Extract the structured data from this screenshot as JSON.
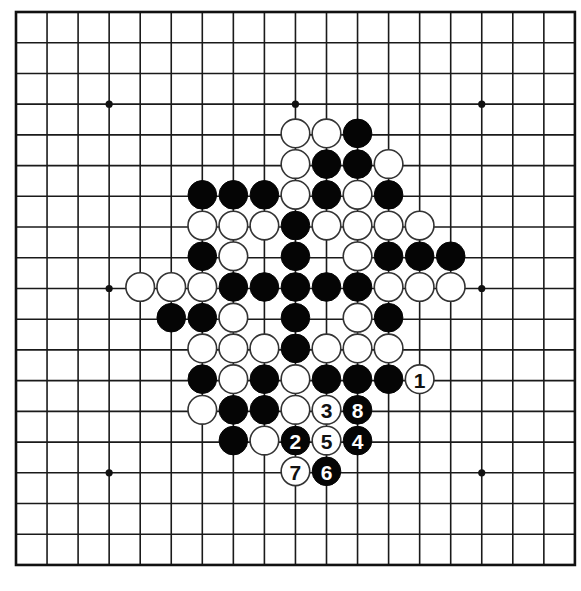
{
  "board": {
    "size": 19,
    "origin_x": 16,
    "origin_y": 12,
    "spacing_x": 31.05,
    "spacing_y": 30.72,
    "stone_radius": 14.3,
    "colors": {
      "background": "#ffffff",
      "line": "#1a1a1a",
      "black_stone": "#050505",
      "white_stone": "#ffffff",
      "white_outline": "#333333"
    },
    "star_points": [
      [
        3,
        3
      ],
      [
        3,
        9
      ],
      [
        3,
        15
      ],
      [
        9,
        3
      ],
      [
        9,
        9
      ],
      [
        9,
        15
      ],
      [
        15,
        3
      ],
      [
        15,
        9
      ],
      [
        15,
        15
      ]
    ]
  },
  "stones": [
    {
      "row": 4,
      "col": 9,
      "color": "white"
    },
    {
      "row": 4,
      "col": 10,
      "color": "white"
    },
    {
      "row": 4,
      "col": 11,
      "color": "black"
    },
    {
      "row": 5,
      "col": 9,
      "color": "white"
    },
    {
      "row": 5,
      "col": 10,
      "color": "black"
    },
    {
      "row": 5,
      "col": 11,
      "color": "black"
    },
    {
      "row": 5,
      "col": 12,
      "color": "white"
    },
    {
      "row": 6,
      "col": 6,
      "color": "black"
    },
    {
      "row": 6,
      "col": 7,
      "color": "black"
    },
    {
      "row": 6,
      "col": 8,
      "color": "black"
    },
    {
      "row": 6,
      "col": 9,
      "color": "white"
    },
    {
      "row": 6,
      "col": 10,
      "color": "black"
    },
    {
      "row": 6,
      "col": 11,
      "color": "white"
    },
    {
      "row": 6,
      "col": 12,
      "color": "black"
    },
    {
      "row": 7,
      "col": 6,
      "color": "white"
    },
    {
      "row": 7,
      "col": 7,
      "color": "white"
    },
    {
      "row": 7,
      "col": 8,
      "color": "white"
    },
    {
      "row": 7,
      "col": 9,
      "color": "black"
    },
    {
      "row": 7,
      "col": 10,
      "color": "white"
    },
    {
      "row": 7,
      "col": 11,
      "color": "white"
    },
    {
      "row": 7,
      "col": 12,
      "color": "white"
    },
    {
      "row": 7,
      "col": 13,
      "color": "white"
    },
    {
      "row": 8,
      "col": 6,
      "color": "black"
    },
    {
      "row": 8,
      "col": 7,
      "color": "white"
    },
    {
      "row": 8,
      "col": 9,
      "color": "black"
    },
    {
      "row": 8,
      "col": 11,
      "color": "white"
    },
    {
      "row": 8,
      "col": 12,
      "color": "black"
    },
    {
      "row": 8,
      "col": 13,
      "color": "black"
    },
    {
      "row": 8,
      "col": 14,
      "color": "black"
    },
    {
      "row": 9,
      "col": 4,
      "color": "white"
    },
    {
      "row": 9,
      "col": 5,
      "color": "white"
    },
    {
      "row": 9,
      "col": 6,
      "color": "white"
    },
    {
      "row": 9,
      "col": 7,
      "color": "black"
    },
    {
      "row": 9,
      "col": 8,
      "color": "black"
    },
    {
      "row": 9,
      "col": 9,
      "color": "black"
    },
    {
      "row": 9,
      "col": 10,
      "color": "black"
    },
    {
      "row": 9,
      "col": 11,
      "color": "black"
    },
    {
      "row": 9,
      "col": 12,
      "color": "white"
    },
    {
      "row": 9,
      "col": 13,
      "color": "white"
    },
    {
      "row": 9,
      "col": 14,
      "color": "white"
    },
    {
      "row": 10,
      "col": 5,
      "color": "black"
    },
    {
      "row": 10,
      "col": 6,
      "color": "black"
    },
    {
      "row": 10,
      "col": 7,
      "color": "white"
    },
    {
      "row": 10,
      "col": 9,
      "color": "black"
    },
    {
      "row": 10,
      "col": 11,
      "color": "white"
    },
    {
      "row": 10,
      "col": 12,
      "color": "black"
    },
    {
      "row": 11,
      "col": 6,
      "color": "white"
    },
    {
      "row": 11,
      "col": 7,
      "color": "white"
    },
    {
      "row": 11,
      "col": 8,
      "color": "white"
    },
    {
      "row": 11,
      "col": 9,
      "color": "black"
    },
    {
      "row": 11,
      "col": 10,
      "color": "white"
    },
    {
      "row": 11,
      "col": 11,
      "color": "white"
    },
    {
      "row": 11,
      "col": 12,
      "color": "white"
    },
    {
      "row": 12,
      "col": 6,
      "color": "black"
    },
    {
      "row": 12,
      "col": 7,
      "color": "white"
    },
    {
      "row": 12,
      "col": 8,
      "color": "black"
    },
    {
      "row": 12,
      "col": 9,
      "color": "white"
    },
    {
      "row": 12,
      "col": 10,
      "color": "black"
    },
    {
      "row": 12,
      "col": 11,
      "color": "black"
    },
    {
      "row": 12,
      "col": 12,
      "color": "black"
    },
    {
      "row": 12,
      "col": 13,
      "color": "white",
      "label": "1"
    },
    {
      "row": 13,
      "col": 6,
      "color": "white"
    },
    {
      "row": 13,
      "col": 7,
      "color": "black"
    },
    {
      "row": 13,
      "col": 8,
      "color": "black"
    },
    {
      "row": 13,
      "col": 9,
      "color": "white"
    },
    {
      "row": 13,
      "col": 10,
      "color": "white",
      "label": "3"
    },
    {
      "row": 13,
      "col": 11,
      "color": "black",
      "label": "8"
    },
    {
      "row": 14,
      "col": 7,
      "color": "black"
    },
    {
      "row": 14,
      "col": 8,
      "color": "white"
    },
    {
      "row": 14,
      "col": 9,
      "color": "black",
      "label": "2"
    },
    {
      "row": 14,
      "col": 10,
      "color": "white",
      "label": "5"
    },
    {
      "row": 14,
      "col": 11,
      "color": "black",
      "label": "4"
    },
    {
      "row": 15,
      "col": 9,
      "color": "white",
      "label": "7"
    },
    {
      "row": 15,
      "col": 10,
      "color": "black",
      "label": "6"
    }
  ],
  "move_sequence": [
    {
      "move": 1,
      "color": "white",
      "row": 12,
      "col": 13
    },
    {
      "move": 2,
      "color": "black",
      "row": 14,
      "col": 9
    },
    {
      "move": 3,
      "color": "white",
      "row": 13,
      "col": 10
    },
    {
      "move": 4,
      "color": "black",
      "row": 14,
      "col": 11
    },
    {
      "move": 5,
      "color": "white",
      "row": 14,
      "col": 10
    },
    {
      "move": 6,
      "color": "black",
      "row": 15,
      "col": 10
    },
    {
      "move": 7,
      "color": "white",
      "row": 15,
      "col": 9
    },
    {
      "move": 8,
      "color": "black",
      "row": 13,
      "col": 11
    }
  ]
}
